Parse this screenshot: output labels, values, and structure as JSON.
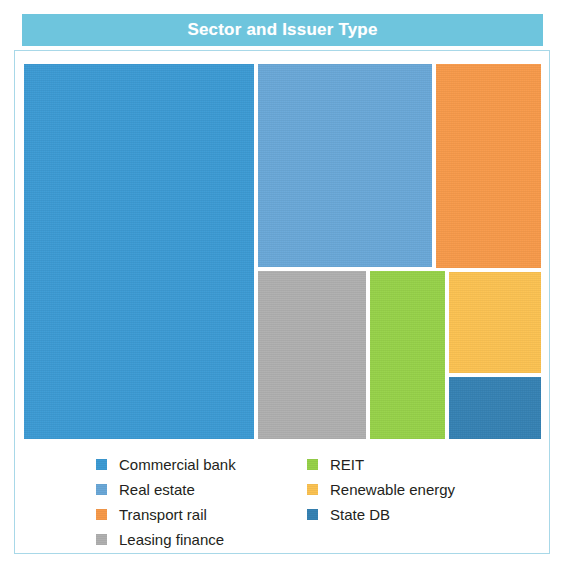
{
  "header": {
    "title": "Sector and Issuer Type",
    "band_color": "#6ec5dd",
    "title_color": "#ffffff"
  },
  "panel": {
    "border_color": "#a8d8e8",
    "background": "#ffffff"
  },
  "legend": {
    "columns": [
      {
        "items": [
          {
            "label": "Commercial bank",
            "color": "#3d9bd4"
          },
          {
            "label": "Real estate",
            "color": "#6aa8d8"
          },
          {
            "label": "Transport rail",
            "color": "#f79a4b"
          },
          {
            "label": "Leasing finance",
            "color": "#b0b0b0"
          }
        ]
      },
      {
        "items": [
          {
            "label": "REIT",
            "color": "#97d24a"
          },
          {
            "label": "Renewable energy",
            "color": "#fbc252"
          },
          {
            "label": "State DB",
            "color": "#3682b4"
          }
        ]
      }
    ]
  },
  "chart_data": {
    "type": "treemap",
    "title": "Sector and Issuer Type",
    "xlabel": "",
    "ylabel": "",
    "grid": false,
    "legend_position": "bottom",
    "categories": [
      "Commercial bank",
      "Real estate",
      "Transport rail",
      "Leasing finance",
      "REIT",
      "Renewable energy",
      "State DB"
    ],
    "values": [
      45.4,
      17.2,
      13.2,
      8.0,
      6.0,
      5.6,
      4.6
    ],
    "value_unit": "percent of total area",
    "series": [
      {
        "name": "Share of issuance",
        "values": [
          45.4,
          17.2,
          13.2,
          8.0,
          6.0,
          5.6,
          4.6
        ]
      }
    ],
    "nodes": [
      {
        "label": "Commercial bank",
        "color": "#3d9bd4",
        "value": 45.4,
        "rect": {
          "x": 0,
          "y": 0,
          "w": 234,
          "h": 379
        }
      },
      {
        "label": "Real estate",
        "color": "#6aa8d8",
        "value": 17.2,
        "rect": {
          "x": 234,
          "y": 0,
          "w": 178,
          "h": 207
        }
      },
      {
        "label": "Transport rail",
        "color": "#f79a4b",
        "value": 13.2,
        "rect": {
          "x": 412,
          "y": 0,
          "w": 109,
          "h": 208
        }
      },
      {
        "label": "Leasing finance",
        "color": "#b0b0b0",
        "value": 8.0,
        "rect": {
          "x": 234,
          "y": 207,
          "w": 112,
          "h": 172
        }
      },
      {
        "label": "REIT",
        "color": "#97d24a",
        "value": 6.0,
        "rect": {
          "x": 346,
          "y": 207,
          "w": 79,
          "h": 172
        }
      },
      {
        "label": "Renewable energy",
        "color": "#fbc252",
        "value": 5.6,
        "rect": {
          "x": 425,
          "y": 208,
          "w": 96,
          "h": 105
        }
      },
      {
        "label": "State DB",
        "color": "#3682b4",
        "value": 4.6,
        "rect": {
          "x": 425,
          "y": 313,
          "w": 96,
          "h": 66
        }
      }
    ]
  }
}
